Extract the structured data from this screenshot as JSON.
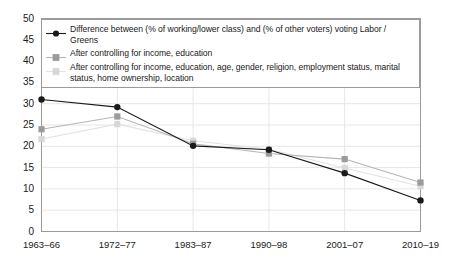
{
  "chart_data": {
    "type": "line",
    "title": "",
    "subtitle": "",
    "xlabel": "",
    "ylabel": "",
    "ylim": [
      0,
      50
    ],
    "yticks": [
      0,
      5,
      10,
      15,
      20,
      25,
      30,
      35,
      40,
      45,
      50
    ],
    "grid": true,
    "legend_position": "top-left-inside",
    "categories": [
      "1963–66",
      "1972–77",
      "1983–87",
      "1990–98",
      "2001–07",
      "2010–19"
    ],
    "series": [
      {
        "name": "Difference between (% of working/lower class) and (% of other voters) voting Labor / Greens",
        "color": "#1a1a1a",
        "marker": "circle",
        "values": [
          31.0,
          29.2,
          20.1,
          19.2,
          13.7,
          7.3
        ]
      },
      {
        "name": "After controlling for income, education",
        "color": "#9b9b9b",
        "marker": "square",
        "values": [
          24.0,
          27.0,
          20.6,
          18.3,
          17.0,
          11.5
        ]
      },
      {
        "name": "After controlling for income, education, age, gender, religion, employment status, marital status, home ownership, location",
        "color": "#d8d8d8",
        "marker": "square",
        "values": [
          21.7,
          25.2,
          21.3,
          19.3,
          14.9,
          10.6
        ]
      }
    ]
  },
  "legend": {
    "entries": [
      "Difference between (% of working/lower class) and (% of other voters) voting Labor / Greens",
      "After controlling for income, education",
      "After controlling for income, education, age, gender, religion, employment status, marital status, home ownership, location"
    ]
  },
  "axes": {
    "y_tick_labels": [
      "50",
      "45",
      "40",
      "35",
      "30",
      "25",
      "20",
      "15",
      "10",
      "5",
      "0"
    ],
    "x_tick_labels": [
      "1963–66",
      "1972–77",
      "1983–87",
      "1990–98",
      "2001–07",
      "2010–19"
    ]
  },
  "colors": {
    "series1": "#1a1a1a",
    "series2": "#9b9b9b",
    "series3": "#d8d8d8",
    "axis": "#808080",
    "grid": "#e6e6e6",
    "text": "#1a1a1a"
  }
}
